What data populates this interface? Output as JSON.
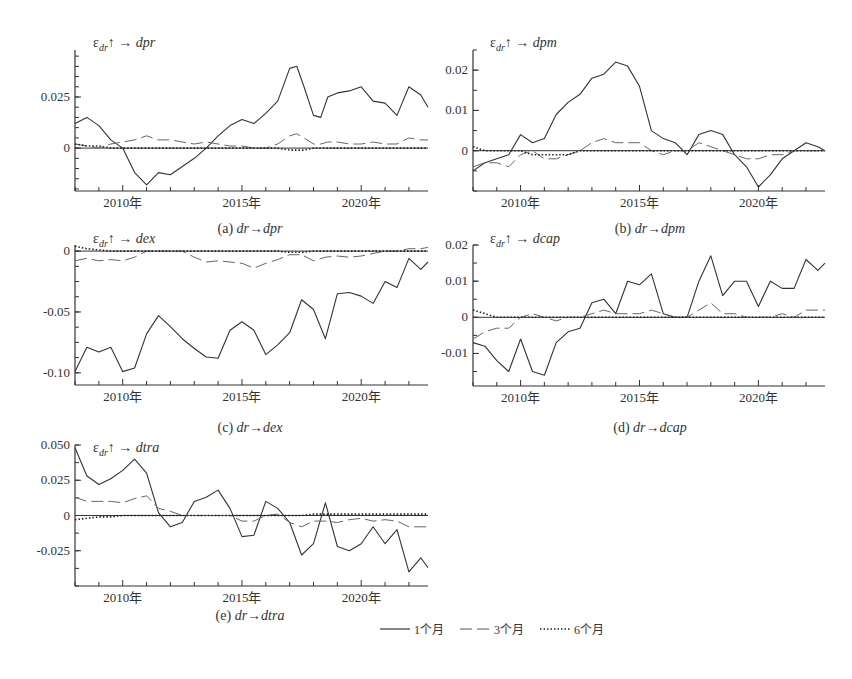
{
  "figure": {
    "legend": [
      {
        "label": "1个月",
        "style": "solid"
      },
      {
        "label": "3个月",
        "style": "dashed"
      },
      {
        "label": "6个月",
        "style": "dotted"
      }
    ]
  },
  "chart_data": [
    {
      "id": "a",
      "type": "line",
      "title": "ε_dr↑ → dpr",
      "caption": "(a)  dr→dpr",
      "xlabel": "",
      "ylabel": "",
      "xticks": [
        "2010年",
        "2015年",
        "2020年"
      ],
      "xlim": [
        2008.0,
        2022.8
      ],
      "yticks": [
        0,
        0.025
      ],
      "ylim": [
        -0.021,
        0.048
      ],
      "x": [
        2008.0,
        2008.5,
        2009.0,
        2009.5,
        2010.0,
        2010.5,
        2011.0,
        2011.5,
        2012.0,
        2012.5,
        2013.0,
        2013.5,
        2014.0,
        2014.5,
        2015.0,
        2015.5,
        2016.0,
        2016.5,
        2017.0,
        2017.3,
        2017.6,
        2018.0,
        2018.3,
        2018.6,
        2019.0,
        2019.5,
        2020.0,
        2020.5,
        2021.0,
        2021.5,
        2022.0,
        2022.5,
        2022.8
      ],
      "series": [
        {
          "name": "1个月",
          "values": [
            0.012,
            0.015,
            0.011,
            0.004,
            0.0,
            -0.012,
            -0.018,
            -0.012,
            -0.013,
            -0.009,
            -0.005,
            0.0,
            0.006,
            0.011,
            0.014,
            0.012,
            0.017,
            0.023,
            0.039,
            0.04,
            0.03,
            0.016,
            0.015,
            0.025,
            0.027,
            0.028,
            0.03,
            0.023,
            0.022,
            0.016,
            0.03,
            0.026,
            0.02
          ]
        },
        {
          "name": "3个月",
          "values": [
            0.002,
            0.001,
            0.0,
            0.002,
            0.003,
            0.004,
            0.006,
            0.004,
            0.004,
            0.003,
            0.002,
            0.003,
            0.002,
            0.001,
            0.001,
            0.0,
            0.0,
            0.002,
            0.006,
            0.007,
            0.005,
            0.002,
            0.002,
            0.003,
            0.003,
            0.002,
            0.002,
            0.003,
            0.002,
            0.002,
            0.005,
            0.004,
            0.004
          ]
        },
        {
          "name": "6个月",
          "values": [
            0.002,
            0.001,
            0.001,
            0.0,
            0.0,
            0.0,
            0.0,
            0.0,
            0.0,
            0.0,
            0.0,
            0.0,
            0.0,
            0.0,
            0.0,
            0.0,
            0.0,
            0.0,
            -0.001,
            -0.001,
            -0.001,
            0.0,
            0.0,
            0.0,
            0.0,
            0.0,
            0.0,
            0.0,
            0.0,
            0.0,
            0.0,
            0.0,
            0.0
          ]
        }
      ]
    },
    {
      "id": "b",
      "type": "line",
      "title": "ε_dr↑ → dpm",
      "caption": "(b)  dr→dpm",
      "xlabel": "",
      "ylabel": "",
      "xticks": [
        "2010年",
        "2015年",
        "2020年"
      ],
      "xlim": [
        2008.0,
        2022.8
      ],
      "yticks": [
        0,
        0.01,
        0.02
      ],
      "ylim": [
        -0.01,
        0.025
      ],
      "x": [
        2008.0,
        2008.5,
        2009.0,
        2009.5,
        2010.0,
        2010.5,
        2011.0,
        2011.5,
        2012.0,
        2012.5,
        2013.0,
        2013.5,
        2014.0,
        2014.5,
        2015.0,
        2015.5,
        2016.0,
        2016.5,
        2017.0,
        2017.5,
        2018.0,
        2018.5,
        2019.0,
        2019.5,
        2020.0,
        2020.5,
        2021.0,
        2021.5,
        2022.0,
        2022.5,
        2022.8
      ],
      "series": [
        {
          "name": "1个月",
          "values": [
            -0.005,
            -0.003,
            -0.002,
            -0.001,
            0.004,
            0.002,
            0.003,
            0.009,
            0.012,
            0.014,
            0.018,
            0.019,
            0.022,
            0.021,
            0.016,
            0.005,
            0.003,
            0.002,
            -0.001,
            0.004,
            0.005,
            0.004,
            -0.001,
            -0.004,
            -0.009,
            -0.006,
            -0.002,
            0.0,
            0.002,
            0.001,
            0.0
          ]
        },
        {
          "name": "3个月",
          "values": [
            -0.004,
            -0.003,
            -0.003,
            -0.004,
            -0.001,
            0.0,
            -0.002,
            -0.002,
            -0.001,
            0.0,
            0.002,
            0.003,
            0.002,
            0.002,
            0.002,
            0.0,
            -0.001,
            0.0,
            0.0,
            0.002,
            0.001,
            0.0,
            -0.001,
            -0.002,
            -0.002,
            -0.001,
            -0.001,
            0.0,
            0.0,
            0.0,
            0.0
          ]
        },
        {
          "name": "6个月",
          "values": [
            0.001,
            0.0,
            0.0,
            0.0,
            0.0,
            -0.001,
            -0.001,
            -0.001,
            -0.001,
            0.0,
            0.0,
            0.0,
            0.0,
            0.0,
            0.0,
            0.0,
            0.0,
            0.0,
            0.0,
            0.0,
            0.0,
            0.0,
            0.0,
            0.0,
            0.0,
            0.0,
            0.0,
            0.0,
            0.0,
            0.0,
            0.0
          ]
        }
      ]
    },
    {
      "id": "c",
      "type": "line",
      "title": "ε_dr↑ → dex",
      "caption": "(c)  dr→dex",
      "xlabel": "",
      "ylabel": "",
      "xticks": [
        "2010年",
        "2015年",
        "2020年"
      ],
      "xlim": [
        2008.0,
        2022.8
      ],
      "yticks": [
        0,
        -0.05,
        -0.1
      ],
      "ylim": [
        -0.11,
        0.005
      ],
      "x": [
        2008.0,
        2008.5,
        2009.0,
        2009.5,
        2010.0,
        2010.5,
        2011.0,
        2011.5,
        2012.0,
        2012.5,
        2013.0,
        2013.5,
        2014.0,
        2014.5,
        2015.0,
        2015.5,
        2016.0,
        2016.5,
        2017.0,
        2017.5,
        2018.0,
        2018.5,
        2019.0,
        2019.5,
        2020.0,
        2020.5,
        2021.0,
        2021.5,
        2022.0,
        2022.5,
        2022.8
      ],
      "series": [
        {
          "name": "1个月",
          "values": [
            -0.099,
            -0.079,
            -0.083,
            -0.079,
            -0.099,
            -0.096,
            -0.068,
            -0.053,
            -0.062,
            -0.072,
            -0.08,
            -0.087,
            -0.088,
            -0.065,
            -0.058,
            -0.065,
            -0.085,
            -0.077,
            -0.067,
            -0.04,
            -0.048,
            -0.072,
            -0.035,
            -0.034,
            -0.037,
            -0.043,
            -0.025,
            -0.03,
            -0.006,
            -0.015,
            -0.009
          ]
        },
        {
          "name": "3个月",
          "values": [
            -0.008,
            -0.006,
            -0.008,
            -0.007,
            -0.008,
            -0.005,
            0.0,
            0.0,
            0.0,
            0.0,
            -0.005,
            -0.009,
            -0.008,
            -0.009,
            -0.01,
            -0.014,
            -0.01,
            -0.007,
            -0.003,
            -0.003,
            -0.008,
            -0.005,
            -0.004,
            -0.005,
            -0.004,
            -0.002,
            0.0,
            0.0,
            0.002,
            0.002,
            0.003
          ]
        },
        {
          "name": "6个月",
          "values": [
            0.004,
            0.002,
            0.001,
            0.0,
            0.0,
            0.0,
            0.0,
            0.0,
            0.0,
            0.0,
            0.0,
            0.0,
            0.0,
            0.0,
            0.0,
            0.0,
            0.0,
            0.0,
            -0.001,
            -0.001,
            0.0,
            0.0,
            0.0,
            0.0,
            0.0,
            0.0,
            0.0,
            0.0,
            0.0,
            0.0,
            0.0
          ]
        }
      ]
    },
    {
      "id": "d",
      "type": "line",
      "title": "ε_dr↑ → dcap",
      "caption": "(d)  dr→dcap",
      "xlabel": "",
      "ylabel": "",
      "xticks": [
        "2010年",
        "2015年",
        "2020年"
      ],
      "xlim": [
        2008.0,
        2022.8
      ],
      "yticks": [
        0.02,
        0.01,
        0,
        -0.01
      ],
      "ylim": [
        -0.019,
        0.02
      ],
      "x": [
        2008.0,
        2008.5,
        2009.0,
        2009.5,
        2010.0,
        2010.5,
        2011.0,
        2011.5,
        2012.0,
        2012.5,
        2013.0,
        2013.5,
        2014.0,
        2014.5,
        2015.0,
        2015.5,
        2016.0,
        2016.5,
        2017.0,
        2017.5,
        2018.0,
        2018.5,
        2019.0,
        2019.5,
        2020.0,
        2020.5,
        2021.0,
        2021.5,
        2022.0,
        2022.5,
        2022.8
      ],
      "series": [
        {
          "name": "1个月",
          "values": [
            -0.007,
            -0.008,
            -0.012,
            -0.015,
            -0.006,
            -0.015,
            -0.016,
            -0.007,
            -0.004,
            -0.003,
            0.004,
            0.005,
            0.001,
            0.01,
            0.009,
            0.012,
            0.001,
            0.0,
            0.0,
            0.01,
            0.017,
            0.006,
            0.01,
            0.01,
            0.003,
            0.01,
            0.008,
            0.008,
            0.016,
            0.013,
            0.015
          ]
        },
        {
          "name": "3个月",
          "values": [
            -0.006,
            -0.004,
            -0.003,
            -0.003,
            0.0,
            0.001,
            0.0,
            -0.001,
            0.0,
            0.0,
            0.001,
            0.002,
            0.001,
            0.001,
            0.001,
            0.002,
            0.001,
            0.0,
            0.0,
            0.002,
            0.004,
            0.001,
            0.001,
            0.0,
            0.0,
            0.0,
            0.001,
            0.0,
            0.002,
            0.002,
            0.002
          ]
        },
        {
          "name": "6个月",
          "values": [
            0.002,
            0.001,
            0.0,
            0.0,
            0.0,
            0.0,
            0.0,
            0.0,
            0.0,
            0.0,
            0.0,
            0.0,
            0.0,
            0.0,
            0.0,
            0.0,
            0.0,
            0.0,
            0.0,
            0.0,
            0.0,
            0.0,
            0.0,
            0.0,
            0.0,
            0.0,
            0.0,
            0.0,
            0.0,
            0.0,
            0.0
          ]
        }
      ]
    },
    {
      "id": "e",
      "type": "line",
      "title": "ε_dr↑ → dtra",
      "caption": "(e)  dr→dtra",
      "xlabel": "",
      "ylabel": "",
      "xticks": [
        "2010年",
        "2015年",
        "2020年"
      ],
      "xlim": [
        2008.0,
        2022.8
      ],
      "yticks": [
        0.05,
        0.025,
        0,
        -0.025
      ],
      "ylim": [
        -0.05,
        0.05
      ],
      "x": [
        2008.0,
        2008.5,
        2009.0,
        2009.5,
        2010.0,
        2010.5,
        2011.0,
        2011.5,
        2012.0,
        2012.5,
        2013.0,
        2013.5,
        2014.0,
        2014.5,
        2015.0,
        2015.5,
        2016.0,
        2016.5,
        2017.0,
        2017.5,
        2018.0,
        2018.5,
        2019.0,
        2019.5,
        2020.0,
        2020.5,
        2021.0,
        2021.5,
        2022.0,
        2022.5,
        2022.8
      ],
      "series": [
        {
          "name": "1个月",
          "values": [
            0.048,
            0.028,
            0.022,
            0.026,
            0.032,
            0.04,
            0.03,
            0.002,
            -0.008,
            -0.005,
            0.01,
            0.013,
            0.018,
            0.005,
            -0.015,
            -0.014,
            0.01,
            0.005,
            -0.005,
            -0.028,
            -0.02,
            0.009,
            -0.022,
            -0.025,
            -0.02,
            -0.008,
            -0.02,
            -0.01,
            -0.04,
            -0.03,
            -0.037
          ]
        },
        {
          "name": "3个月",
          "values": [
            0.013,
            0.01,
            0.01,
            0.01,
            0.009,
            0.012,
            0.014,
            0.005,
            0.003,
            0.0,
            0.0,
            0.0,
            0.0,
            0.0,
            -0.004,
            -0.004,
            0.0,
            0.001,
            -0.005,
            -0.008,
            -0.004,
            -0.004,
            -0.005,
            -0.003,
            -0.002,
            -0.004,
            -0.003,
            -0.004,
            -0.008,
            -0.008,
            -0.008
          ]
        },
        {
          "name": "6个月",
          "values": [
            -0.003,
            -0.002,
            -0.001,
            -0.001,
            0.0,
            0.0,
            0.0,
            0.0,
            0.0,
            0.0,
            0.0,
            0.0,
            0.0,
            0.0,
            0.0,
            0.0,
            0.0,
            0.0,
            0.0,
            0.0,
            0.001,
            0.001,
            0.001,
            0.001,
            0.001,
            0.001,
            0.001,
            0.001,
            0.001,
            0.001,
            0.001
          ]
        }
      ]
    }
  ]
}
